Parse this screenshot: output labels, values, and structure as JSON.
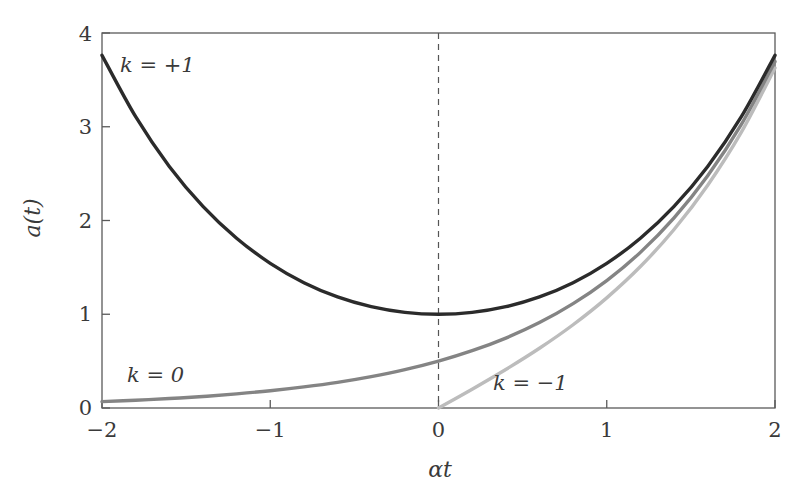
{
  "chart_data": {
    "type": "line",
    "title": "",
    "xlabel": "αt",
    "ylabel": "a(t)",
    "xlim": [
      -2,
      2
    ],
    "ylim": [
      0,
      4
    ],
    "xticks": [
      -2,
      -1,
      0,
      1,
      2
    ],
    "yticks": [
      0,
      1,
      2,
      3,
      4
    ],
    "xtick_labels": [
      "−2",
      "−1",
      "0",
      "1",
      "2"
    ],
    "ytick_labels": [
      "0",
      "1",
      "2",
      "3",
      "4"
    ],
    "grid": false,
    "legend_position": "inline-annotations",
    "annotations": [
      {
        "text": "k = +1",
        "x": -1.6,
        "y": 3.45
      },
      {
        "text": "k = 0",
        "x": -1.55,
        "y": 0.62
      },
      {
        "text": "k = −1",
        "x": 0.35,
        "y": 0.5
      }
    ],
    "vertical_reference_line": {
      "x": 0,
      "style": "dashed"
    },
    "series": [
      {
        "name": "k = +1",
        "formula": "cosh(αt)",
        "color": "#2b2b2b",
        "x": [
          -2,
          -1.8,
          -1.6,
          -1.4,
          -1.2,
          -1,
          -0.8,
          -0.6,
          -0.4,
          -0.2,
          0,
          0.2,
          0.4,
          0.6,
          0.8,
          1,
          1.2,
          1.4,
          1.6,
          1.8,
          2
        ],
        "values": [
          3.762,
          3.107,
          2.577,
          2.151,
          1.811,
          1.543,
          1.337,
          1.185,
          1.081,
          1.02,
          1.0,
          1.02,
          1.081,
          1.185,
          1.337,
          1.543,
          1.811,
          2.151,
          2.577,
          3.107,
          3.762
        ]
      },
      {
        "name": "k = 0",
        "formula": "exp(αt)/2",
        "color": "#848484",
        "x": [
          -2,
          -1.8,
          -1.6,
          -1.4,
          -1.2,
          -1,
          -0.8,
          -0.6,
          -0.4,
          -0.2,
          0,
          0.2,
          0.4,
          0.6,
          0.8,
          1,
          1.2,
          1.4,
          1.6,
          1.8,
          2
        ],
        "values": [
          0.068,
          0.083,
          0.101,
          0.123,
          0.151,
          0.184,
          0.225,
          0.274,
          0.335,
          0.409,
          0.5,
          0.611,
          0.746,
          0.911,
          1.113,
          1.359,
          1.66,
          2.028,
          2.477,
          3.025,
          3.695
        ]
      },
      {
        "name": "k = −1",
        "formula": "sinh(αt)",
        "color": "#bcbcbc",
        "x": [
          0,
          0.2,
          0.4,
          0.6,
          0.8,
          1,
          1.2,
          1.4,
          1.6,
          1.8,
          2
        ],
        "values": [
          0.0,
          0.201,
          0.411,
          0.637,
          0.888,
          1.175,
          1.509,
          1.904,
          2.376,
          2.942,
          3.627
        ]
      }
    ]
  },
  "figure": {
    "background_color": "#ffffff",
    "frame_color": "#5a5a5a"
  }
}
